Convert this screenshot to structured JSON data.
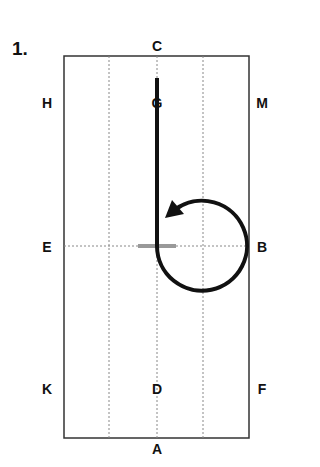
{
  "figure": {
    "number": "1.",
    "letters": {
      "C": "C",
      "G": "G",
      "H": "H",
      "M": "M",
      "E": "E",
      "X": "X",
      "B": "B",
      "K": "K",
      "D": "D",
      "F": "F",
      "A": "A"
    },
    "colors": {
      "line": "#111111",
      "halt_marker": "#999999",
      "grid": "#888888"
    }
  }
}
